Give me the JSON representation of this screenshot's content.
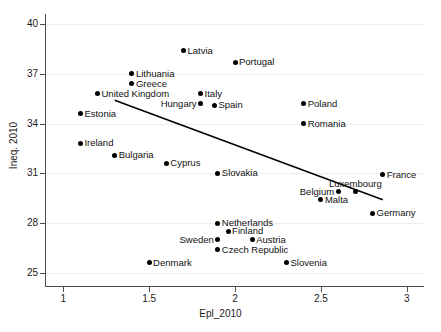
{
  "chart_data": {
    "type": "scatter",
    "title": "",
    "xlabel": "Epl_2010",
    "ylabel": "Ineq. 2010",
    "xlim": [
      0.9,
      3.1
    ],
    "ylim": [
      24.2,
      40.6
    ],
    "xticks": [
      "1",
      "1.5",
      "2",
      "2.5",
      "3"
    ],
    "xtick_values": [
      1,
      1.5,
      2,
      2.5,
      3
    ],
    "yticks": [
      "25",
      "28",
      "31",
      "34",
      "37",
      "40"
    ],
    "ytick_values": [
      25,
      28,
      31,
      34,
      37,
      40
    ],
    "grid": "horizontal",
    "legend": "none",
    "marker_color": "#000000",
    "fit_line_color": "#000000",
    "points": [
      {
        "label": "Latvia",
        "x": 1.7,
        "y": 38.4,
        "label_pos": "right"
      },
      {
        "label": "Portugal",
        "x": 2.0,
        "y": 37.7,
        "label_pos": "right"
      },
      {
        "label": "Lithuania",
        "x": 1.4,
        "y": 37.0,
        "label_pos": "right"
      },
      {
        "label": "Greece",
        "x": 1.4,
        "y": 36.4,
        "label_pos": "right"
      },
      {
        "label": "United Kingdom",
        "x": 1.2,
        "y": 35.8,
        "label_pos": "right"
      },
      {
        "label": "Italy",
        "x": 1.8,
        "y": 35.8,
        "label_pos": "right"
      },
      {
        "label": "Hungary",
        "x": 1.8,
        "y": 35.2,
        "label_pos": "left"
      },
      {
        "label": "Spain",
        "x": 1.88,
        "y": 35.1,
        "label_pos": "right"
      },
      {
        "label": "Poland",
        "x": 2.4,
        "y": 35.2,
        "label_pos": "right"
      },
      {
        "label": "Estonia",
        "x": 1.1,
        "y": 34.6,
        "label_pos": "right"
      },
      {
        "label": "Romania",
        "x": 2.4,
        "y": 34.0,
        "label_pos": "right"
      },
      {
        "label": "Ireland",
        "x": 1.1,
        "y": 32.8,
        "label_pos": "right"
      },
      {
        "label": "Bulgaria",
        "x": 1.3,
        "y": 32.1,
        "label_pos": "right"
      },
      {
        "label": "Cyprus",
        "x": 1.6,
        "y": 31.6,
        "label_pos": "right"
      },
      {
        "label": "Slovakia",
        "x": 1.9,
        "y": 31.0,
        "label_pos": "right"
      },
      {
        "label": "France",
        "x": 2.86,
        "y": 30.9,
        "label_pos": "right"
      },
      {
        "label": "Luxembourg",
        "x": 2.7,
        "y": 29.9,
        "label_pos": "above"
      },
      {
        "label": "Belgium",
        "x": 2.6,
        "y": 29.9,
        "label_pos": "left"
      },
      {
        "label": "Malta",
        "x": 2.5,
        "y": 29.4,
        "label_pos": "right"
      },
      {
        "label": "Germany",
        "x": 2.8,
        "y": 28.6,
        "label_pos": "right"
      },
      {
        "label": "Netherlands",
        "x": 1.9,
        "y": 28.0,
        "label_pos": "right"
      },
      {
        "label": "Finland",
        "x": 1.96,
        "y": 27.5,
        "label_pos": "right"
      },
      {
        "label": "Sweden",
        "x": 1.9,
        "y": 27.0,
        "label_pos": "left"
      },
      {
        "label": "Austria",
        "x": 2.1,
        "y": 27.0,
        "label_pos": "right"
      },
      {
        "label": "Czech Republic",
        "x": 1.9,
        "y": 26.4,
        "label_pos": "right"
      },
      {
        "label": "Denmark",
        "x": 1.5,
        "y": 25.6,
        "label_pos": "right"
      },
      {
        "label": "Slovenia",
        "x": 2.3,
        "y": 25.6,
        "label_pos": "right"
      }
    ],
    "fit_line": {
      "x1": 1.3,
      "y1": 35.4,
      "x2": 2.86,
      "y2": 29.4
    }
  }
}
